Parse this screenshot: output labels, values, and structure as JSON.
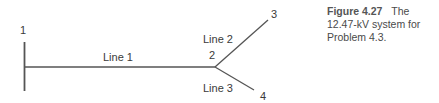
{
  "diagram": {
    "nodes": [
      {
        "id": "1",
        "label": "1"
      },
      {
        "id": "2",
        "label": "2"
      },
      {
        "id": "3",
        "label": "3"
      },
      {
        "id": "4",
        "label": "4"
      }
    ],
    "lines": [
      {
        "label": "Line 1",
        "from": "1",
        "to": "2"
      },
      {
        "label": "Line 2",
        "from": "2",
        "to": "3"
      },
      {
        "label": "Line 3",
        "from": "2",
        "to": "4"
      }
    ],
    "line_color": "#555555"
  },
  "caption": {
    "figure_label": "Figure 4.27",
    "text": "The 12.47-kV system for Problem 4.3."
  }
}
